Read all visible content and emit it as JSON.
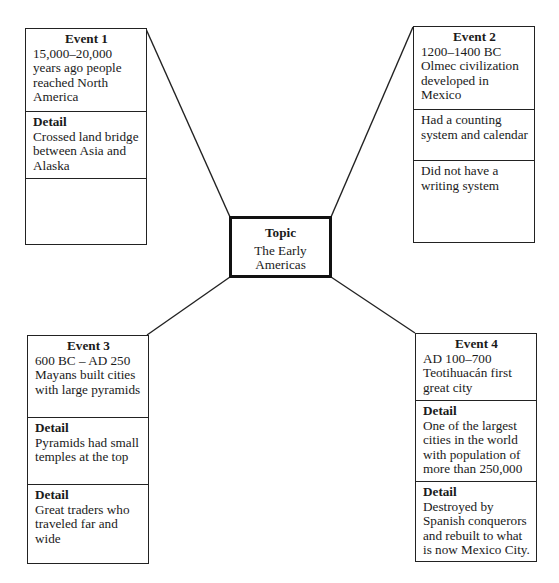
{
  "diagram": {
    "type": "concept-web",
    "topic": {
      "label": "Topic",
      "text": "The Early Americas"
    },
    "events": [
      {
        "title": "Event 1",
        "text": "15,000–20,000 years ago people reached North America",
        "details": [
          {
            "label": "Detail",
            "text": "Crossed land bridge between Asia and Alaska"
          },
          {
            "label": "",
            "text": ""
          }
        ]
      },
      {
        "title": "Event 2",
        "text": "1200–1400 BC Olmec civilization developed in Mexico",
        "details": [
          {
            "label": "",
            "text": "Had a counting system and calendar"
          },
          {
            "label": "",
            "text": "Did not have a writing system"
          }
        ]
      },
      {
        "title": "Event 3",
        "text": "600 BC – AD 250 Mayans built cities with large pyramids",
        "details": [
          {
            "label": "Detail",
            "text": "Pyramids had small temples at the top"
          },
          {
            "label": "Detail",
            "text": "Great traders who traveled far and wide"
          }
        ]
      },
      {
        "title": "Event 4",
        "text": "AD 100–700 Teotihuacán first great city",
        "details": [
          {
            "label": "Detail",
            "text": "One of the largest cities in the world with population of more than 250,000"
          },
          {
            "label": "Detail",
            "text": "Destroyed by Spanish conquerors and rebuilt to what is now Mexico City."
          }
        ]
      }
    ],
    "colors": {
      "line": "#222222",
      "background": "#ffffff",
      "text": "#1a1a1a"
    }
  }
}
